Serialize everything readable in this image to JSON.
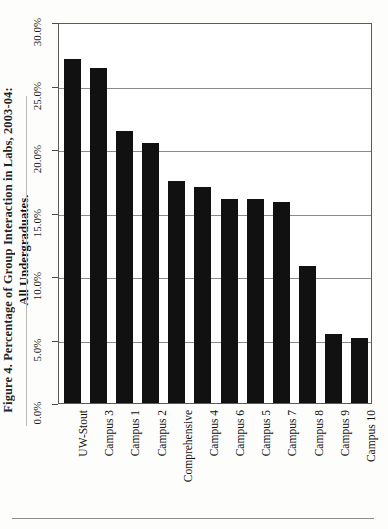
{
  "figure": {
    "title_line1": "Figure 4. Percentage of Group Interaction in Labs, 2003-04:",
    "title_line2": "All Undergraduates.",
    "title_line1_truncated": true
  },
  "chart_data": {
    "type": "bar",
    "title": "Figure 4. Percentage of Group Interaction in Labs, 2003-04: All Undergraduates.",
    "xlabel": "",
    "ylabel": "",
    "categories": [
      "UW-Stout",
      "Campus 3",
      "Campus 1",
      "Campus 2",
      "Comprehensive",
      "Campus 4",
      "Campus 6",
      "Campus 5",
      "Campus 7",
      "Campus 8",
      "Campus 9",
      "Campus 10"
    ],
    "values": [
      27.1,
      26.4,
      21.4,
      20.5,
      17.5,
      17.0,
      16.1,
      16.1,
      15.8,
      10.8,
      5.4,
      5.1
    ],
    "value_labels": [
      "27.1%",
      "26.4%",
      "21.4%",
      "20.5%",
      "17.5%",
      "17.0%",
      "16.1%",
      "16.1%",
      "15.8%",
      "10.8%",
      "5.4%",
      "5.1%"
    ],
    "ylim": [
      0,
      30
    ],
    "ytick_values": [
      0,
      5,
      10,
      15,
      20,
      25,
      30
    ],
    "ytick_labels": [
      "0.0%",
      "5.0%",
      "10.0%",
      "15.0%",
      "20.0%",
      "25.0%",
      "30.0%"
    ],
    "grid": true,
    "grid_axis": "y",
    "legend": null,
    "legend_position": "none",
    "bar_color": "#111111",
    "series_count": 1,
    "orientation": "vertical",
    "xtick_label_rotation": 90,
    "ytick_label_rotation": 90
  },
  "colors": {
    "bar": "#111111",
    "axis": "#5a5a5a",
    "grid": "#8a8a8a",
    "text": "#111111",
    "background": "#ffffff"
  }
}
